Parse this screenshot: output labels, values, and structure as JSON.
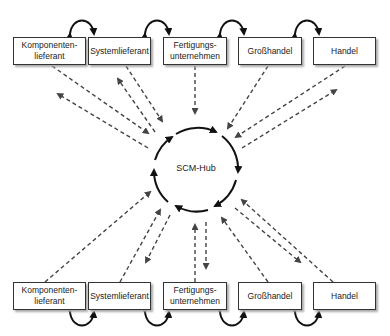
{
  "hub": {
    "label": "SCM-Hub"
  },
  "top_row": [
    {
      "label": "Komponenten-\nlieferant"
    },
    {
      "label": "Systemlieferant"
    },
    {
      "label": "Fertigungs-\nunternehmen"
    },
    {
      "label": "Großhandel"
    },
    {
      "label": "Handel"
    }
  ],
  "bottom_row": [
    {
      "label": "Komponenten-\nlieferant"
    },
    {
      "label": "Systemlieferant"
    },
    {
      "label": "Fertigungs-\nunternehmen"
    },
    {
      "label": "Großhandel"
    },
    {
      "label": "Handel"
    }
  ],
  "colors": {
    "solid": "#111111",
    "dashed": "#444444",
    "box_border": "#333333",
    "shadow": "#aaaaaa"
  }
}
